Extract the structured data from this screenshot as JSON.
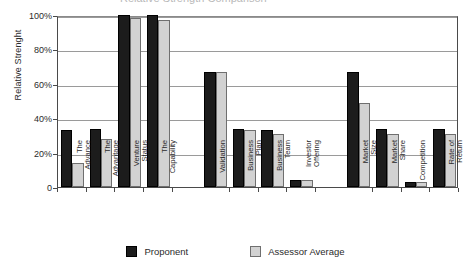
{
  "title_clipped": "Relative Strength Comparison",
  "chart_data": {
    "type": "bar",
    "title": "",
    "xlabel": "",
    "ylabel": "Relative Strenght",
    "ylim": [
      0,
      100
    ],
    "yticks": [
      "0",
      "20%",
      "40%",
      "60%",
      "80%",
      "100%"
    ],
    "ytick_values": [
      0,
      20,
      40,
      60,
      80,
      100
    ],
    "grid": true,
    "legend_position": "bottom",
    "categories": [
      "The\nAdvance",
      "The\nAdvantage",
      "Venture\nStatus",
      "The\nCapability",
      "Validation",
      "Business\nPlan",
      "Business\nTeam",
      "Investor\nOffering",
      "Market\nSize",
      "Market\nShare",
      "Competition",
      "Rate of\nReturn"
    ],
    "groups": [
      {
        "name": "group-1",
        "category_indices": [
          0,
          1,
          2,
          3
        ]
      },
      {
        "name": "group-2",
        "category_indices": [
          4,
          5,
          6,
          7
        ]
      },
      {
        "name": "group-3",
        "category_indices": [
          8,
          9,
          10,
          11
        ]
      }
    ],
    "series": [
      {
        "name": "Proponent",
        "color": "#1c1c1c",
        "values": [
          33,
          34,
          100,
          100,
          67,
          34,
          33,
          4,
          67,
          34,
          3,
          34
        ]
      },
      {
        "name": "Assessor Average",
        "color": "#d2d2d2",
        "values": [
          14,
          28,
          98,
          97,
          67,
          33,
          31,
          4,
          49,
          31,
          3,
          31
        ]
      }
    ]
  },
  "legend": {
    "items": [
      {
        "label": "Proponent",
        "style": "dark"
      },
      {
        "label": "Assessor Average",
        "style": "light"
      }
    ]
  }
}
